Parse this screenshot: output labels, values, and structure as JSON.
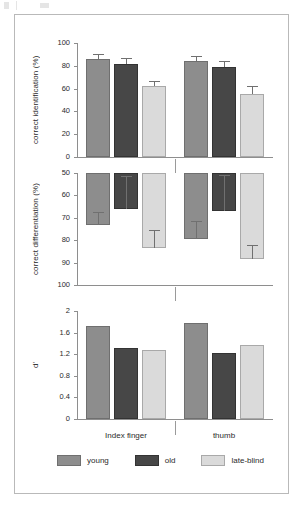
{
  "figure": {
    "x_groups": [
      "Index finger",
      "thumb"
    ],
    "legend": [
      {
        "key": "young",
        "label": "young",
        "color": "#8d8d8d"
      },
      {
        "key": "old",
        "label": "old",
        "color": "#474747"
      },
      {
        "key": "lateblind",
        "label": "late-blind",
        "color": "#dadada"
      }
    ]
  },
  "chart_data": [
    {
      "type": "bar",
      "title": "",
      "panel": "top",
      "xlabel": "",
      "ylabel": "correct identification (%)",
      "ylim": [
        0,
        100
      ],
      "yticks": [
        0,
        20,
        40,
        60,
        80,
        100
      ],
      "inverted": false,
      "grid": false,
      "legend_position": "bottom",
      "categories": [
        "Index finger",
        "thumb"
      ],
      "series": [
        {
          "name": "young",
          "values": [
            86,
            84
          ],
          "errors": [
            4.5,
            5.0
          ]
        },
        {
          "name": "old",
          "values": [
            82,
            79
          ],
          "errors": [
            5.0,
            5.5
          ]
        },
        {
          "name": "late-blind",
          "values": [
            62,
            55
          ],
          "errors": [
            5.0,
            7.5
          ]
        }
      ]
    },
    {
      "type": "bar",
      "title": "",
      "panel": "middle",
      "xlabel": "",
      "ylabel": "correct differentiation (%)",
      "ylim": [
        50,
        100
      ],
      "yticks": [
        50,
        60,
        70,
        80,
        90,
        100
      ],
      "inverted": true,
      "grid": false,
      "legend_position": "bottom",
      "categories": [
        "Index finger",
        "thumb"
      ],
      "series": [
        {
          "name": "young",
          "values": [
            73,
            79.5
          ],
          "errors": [
            5.5,
            8.0
          ]
        },
        {
          "name": "old",
          "values": [
            66,
            67
          ],
          "errors": [
            14.5,
            16.0
          ]
        },
        {
          "name": "late-blind",
          "values": [
            83.5,
            88.5
          ],
          "errors": [
            8.0,
            6.5
          ]
        }
      ]
    },
    {
      "type": "bar",
      "title": "",
      "panel": "bottom",
      "xlabel": "",
      "ylabel": "d'",
      "ylim": [
        0,
        2
      ],
      "yticks": [
        0,
        0.4,
        0.8,
        1.2,
        1.6,
        2
      ],
      "inverted": false,
      "grid": false,
      "legend_position": "bottom",
      "categories": [
        "Index finger",
        "thumb"
      ],
      "series": [
        {
          "name": "young",
          "values": [
            1.72,
            1.78
          ],
          "errors": [
            null,
            null
          ]
        },
        {
          "name": "old",
          "values": [
            1.31,
            1.23
          ],
          "errors": [
            null,
            null
          ]
        },
        {
          "name": "late-blind",
          "values": [
            1.27,
            1.37
          ],
          "errors": [
            null,
            null
          ]
        }
      ]
    }
  ]
}
